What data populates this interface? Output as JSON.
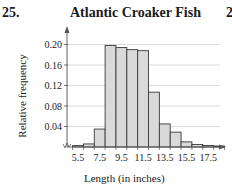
{
  "problem_number": "25.",
  "next_problem_number": "2",
  "chart_data": {
    "type": "bar",
    "title": "Atlantic Croaker Fish",
    "xlabel": "Length (in inches)",
    "ylabel": "Relative frequency",
    "categories": [
      "5.5",
      "6.5",
      "7.5",
      "8.5",
      "9.5",
      "10.5",
      "11.5",
      "12.5",
      "13.5",
      "14.5",
      "15.5",
      "16.5",
      "17.5",
      "18.5"
    ],
    "values": [
      0.003,
      0.006,
      0.035,
      0.198,
      0.194,
      0.19,
      0.188,
      0.107,
      0.045,
      0.029,
      0.01,
      0.005,
      0.003,
      0.002
    ],
    "x_tick_labels": [
      "5.5",
      "7.5",
      "9.5",
      "11.5",
      "13.5",
      "15.5",
      "17.5"
    ],
    "y_tick_labels": [
      "0.04",
      "0.08",
      "0.12",
      "0.16",
      "0.20"
    ],
    "y_ticks": [
      0.04,
      0.08,
      0.12,
      0.16,
      0.2
    ],
    "ylim": [
      0,
      0.22
    ],
    "grid": true,
    "legend": null,
    "bar_fill": "#d9d9d9",
    "bar_edge": "#3a3a3a",
    "grid_color": "#d0d0d0"
  }
}
